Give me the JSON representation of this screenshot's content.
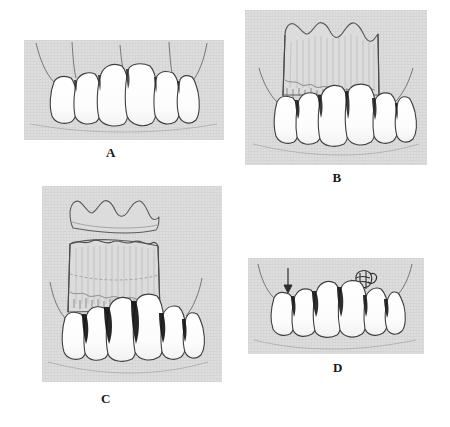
{
  "figure": {
    "type": "medical-illustration",
    "background_color": "#ffffff",
    "panel_background_color": "#dedede",
    "tooth_fill_color": "#fdfdfd",
    "ink_color": "#3a3a3a",
    "width": 450,
    "height": 427
  },
  "panels": [
    {
      "id": "a",
      "label": "A",
      "description": "Six maxillary anterior teeth with receded gingival margins and vertical incision lines",
      "tooth_count": 6,
      "x": 24,
      "y": 40,
      "width": 200,
      "height": 100,
      "label_x": 96,
      "label_y": 145
    },
    {
      "id": "b",
      "label": "B",
      "description": "Scalloped full-thickness gingival flap elevated over the central teeth showing striated connective tissue",
      "tooth_count": 6,
      "scallop_peaks": 3,
      "x": 245,
      "y": 10,
      "width": 182,
      "height": 155,
      "label_x": 322,
      "label_y": 170
    },
    {
      "id": "c",
      "label": "C",
      "description": "Flap split into a separated scalloped epithelial strip above and the underlying graft bed, with dark interdental defects",
      "tooth_count": 6,
      "scallop_peaks": 3,
      "x": 42,
      "y": 186,
      "width": 180,
      "height": 196,
      "label_x": 91,
      "label_y": 391
    },
    {
      "id": "d",
      "label": "D",
      "description": "Repositioned tissue secured with a suture at upper right and a downward directional arrow at upper left",
      "tooth_count": 6,
      "markers": [
        "down-arrow",
        "suture-knot"
      ],
      "x": 248,
      "y": 258,
      "width": 176,
      "height": 96,
      "label_x": 323,
      "label_y": 360
    }
  ]
}
